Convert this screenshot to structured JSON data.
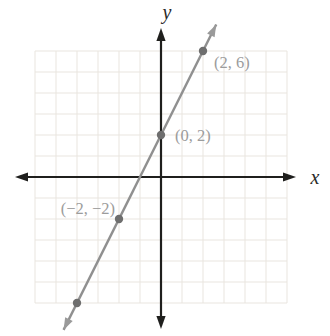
{
  "chart_data": {
    "type": "line",
    "title": "",
    "xlabel": "x",
    "ylabel": "y",
    "xlim": [
      -6,
      6
    ],
    "ylim": [
      -6,
      6
    ],
    "grid": true,
    "grid_step": 1,
    "legend": "none",
    "series": [
      {
        "name": "line-through-points",
        "slope": 2,
        "y_intercept": 2,
        "points": [
          [
            -4,
            -6
          ],
          [
            -2,
            -2
          ],
          [
            0,
            2
          ],
          [
            2,
            6
          ]
        ],
        "draw_extent_x": [
          -4.64,
          2.63
        ],
        "arrows_both_ends": true
      }
    ],
    "marked_points": [
      {
        "x": -4,
        "y": -6,
        "label": "",
        "anchor": "start",
        "dx": 0,
        "dy": 0
      },
      {
        "x": -2,
        "y": -2,
        "label": "(−2, −2)",
        "anchor": "end",
        "dx": -4,
        "dy": -5
      },
      {
        "x": 0,
        "y": 2,
        "label": "(0, 2)",
        "anchor": "start",
        "dx": 14,
        "dy": 6
      },
      {
        "x": 2,
        "y": 6,
        "label": "(2, 6)",
        "anchor": "start",
        "dx": 11,
        "dy": 17
      }
    ],
    "colors": {
      "background": "#ffffff",
      "axis": "#1f1f1d",
      "grid": "#e9e5df",
      "line": "#909090",
      "line_arrow": "#9a9a9a",
      "point": "#6e6e6e",
      "point_label": "#9c9c9c",
      "axis_letter": "#2a2a28"
    }
  }
}
